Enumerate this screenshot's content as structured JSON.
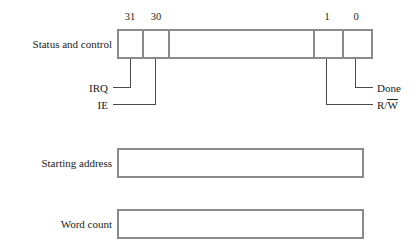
{
  "figure": {
    "border_color": "#8a8a8a",
    "leader_color": "#4a4a4a",
    "text_color": "#1a1a1a",
    "background": "#ffffff"
  },
  "registers": [
    {
      "name": "status-and-control",
      "label": "Status and control"
    },
    {
      "name": "starting-address",
      "label": "Starting address"
    },
    {
      "name": "word-count",
      "label": "Word count"
    }
  ],
  "bit_numbers": [
    {
      "name": "bit-31",
      "label": "31"
    },
    {
      "name": "bit-30",
      "label": "30"
    },
    {
      "name": "bit-1",
      "label": "1"
    },
    {
      "name": "bit-0",
      "label": "0"
    }
  ],
  "signals": [
    {
      "name": "irq",
      "label": "IRQ",
      "bit": "31",
      "side": "left"
    },
    {
      "name": "ie",
      "label": "IE",
      "bit": "30",
      "side": "left"
    },
    {
      "name": "done",
      "label": "Done",
      "bit": "0",
      "side": "right"
    },
    {
      "name": "read-write",
      "label_prefix": "R/",
      "label_overbar": "W",
      "bit": "1",
      "side": "right"
    }
  ]
}
